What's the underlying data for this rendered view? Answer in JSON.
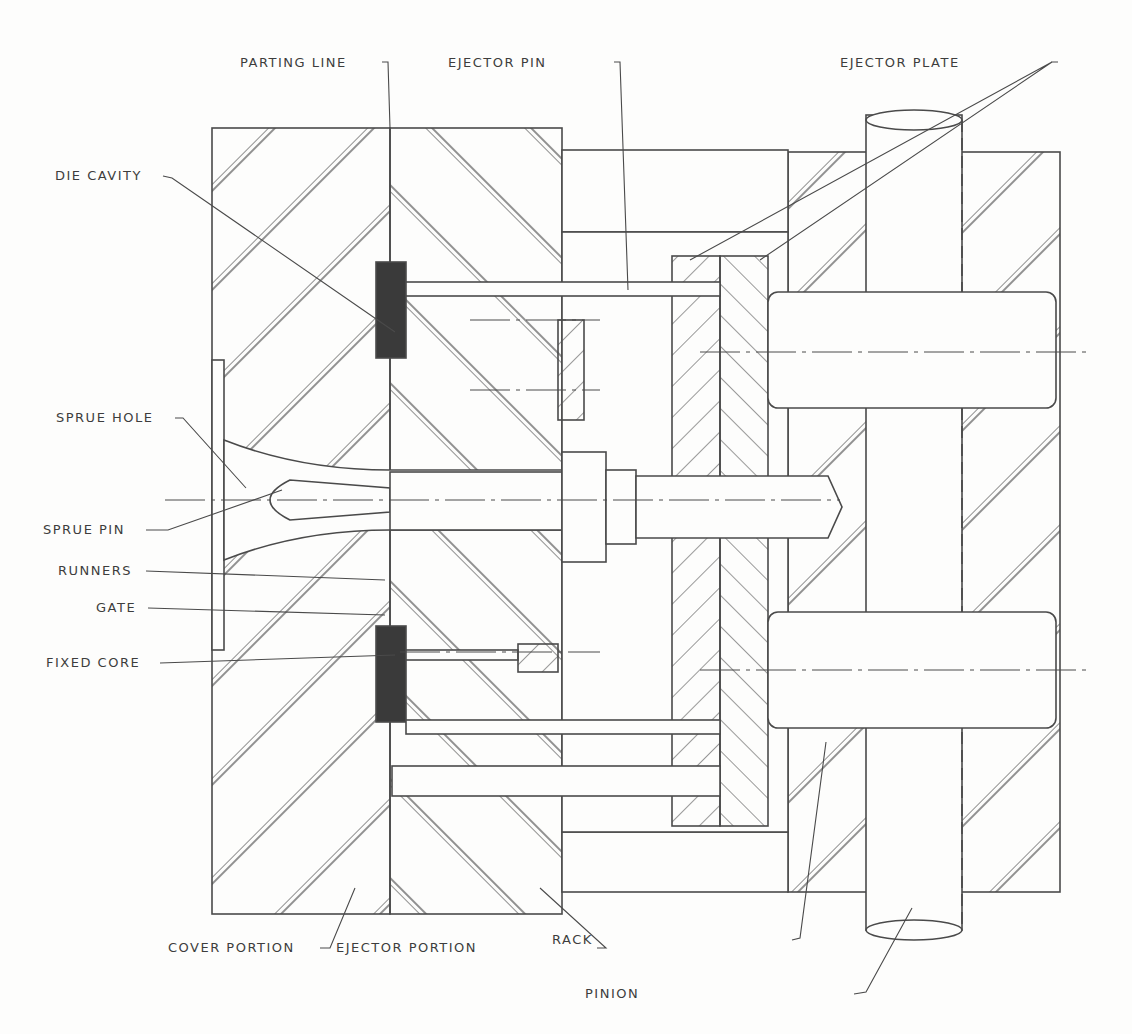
{
  "diagram": {
    "type": "die casting mold cross-section",
    "labels": {
      "parting_line": "PARTING LINE",
      "ejector_pin": "EJECTOR PIN",
      "ejector_plate": "EJECTOR PLATE",
      "die_cavity": "DIE CAVITY",
      "sprue_hole": "SPRUE HOLE",
      "sprue_pin": "SPRUE PIN",
      "runners": "RUNNERS",
      "gate": "GATE",
      "fixed_core": "FIXED CORE",
      "cover_portion": "COVER PORTION",
      "ejector_portion": "EJECTOR PORTION",
      "rack": "RACK",
      "pinion": "PINION"
    },
    "colors": {
      "line": "#4a4a4a",
      "fill_dark": "#3a3a3a",
      "background": "#fdfdfc"
    }
  }
}
